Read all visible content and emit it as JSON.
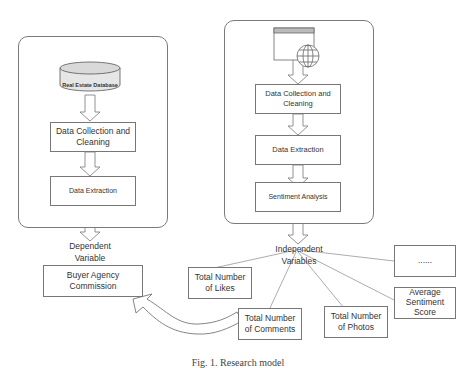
{
  "left_panel": {
    "database_label": "Real Estate Database",
    "steps": [
      "Data Collection and Cleaning",
      "Data Extraction"
    ],
    "output_label": "Dependent Variable",
    "output_box": "Buyer Agency Commission"
  },
  "right_panel": {
    "source_icon": "web-page-globe-icon",
    "steps": [
      "Data Collection and Cleaning",
      "Data Extraction",
      "Sentiment Analysis"
    ],
    "output_label": "Independent Variables",
    "variables": [
      "Total Number of Likes",
      "Total Number of Comments",
      "Total Number of Photos",
      "Average Sentiment Score",
      "......"
    ]
  },
  "caption": "Fig. 1. Research model"
}
